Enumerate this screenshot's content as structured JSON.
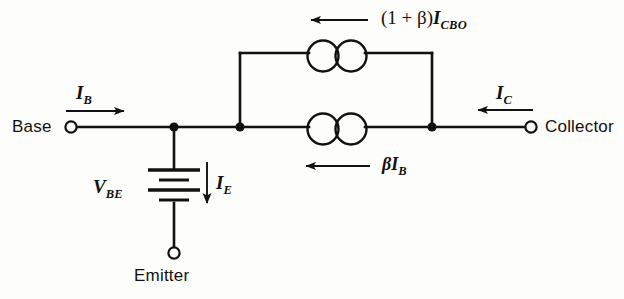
{
  "figure": {
    "type": "circuit-diagram",
    "background_color": "#fdfdfc",
    "line_color": "#111111"
  },
  "terminals": {
    "base": "Base",
    "collector": "Collector",
    "emitter": "Emitter"
  },
  "currents": {
    "base_current": {
      "symbol": "I",
      "subscript": "B",
      "direction": "right"
    },
    "collector_current": {
      "symbol": "I",
      "subscript": "C",
      "direction": "left"
    },
    "emitter_current": {
      "symbol": "I",
      "subscript": "E",
      "direction": "down"
    }
  },
  "sources": {
    "top": {
      "prefix": "(1 + β)",
      "symbol": "I",
      "subscript": "CBO",
      "direction": "left",
      "component": "current-source"
    },
    "bottom": {
      "prefix": "β",
      "symbol": "I",
      "subscript": "B",
      "direction": "left",
      "component": "current-source"
    }
  },
  "battery": {
    "symbol": "V",
    "subscript": "BE",
    "component": "battery",
    "cells": 2
  }
}
